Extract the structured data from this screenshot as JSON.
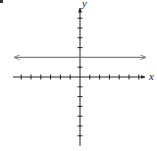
{
  "problem": {
    "marker": "."
  },
  "chart_data": {
    "type": "line",
    "title": "",
    "xlabel": "x",
    "ylabel": "y",
    "xlim": [
      -6,
      6
    ],
    "ylim": [
      -6,
      6
    ],
    "x_ticks": [
      -6,
      -5,
      -4,
      -3,
      -2,
      -1,
      1,
      2,
      3,
      4,
      5,
      6
    ],
    "y_ticks": [
      -6,
      -5,
      -4,
      -3,
      -2,
      -1,
      1,
      2,
      3,
      4,
      5,
      6
    ],
    "grid": false,
    "tick_labels_shown": false,
    "series": [
      {
        "name": "horizontal line",
        "equation": "y = 2",
        "x": [
          -6.7,
          6.7
        ],
        "y": [
          2,
          2
        ],
        "arrows_both_ends": true,
        "color": "#808080"
      }
    ],
    "axes_color": "#222222"
  },
  "axes": {
    "x_label": "x",
    "y_label": "y"
  }
}
